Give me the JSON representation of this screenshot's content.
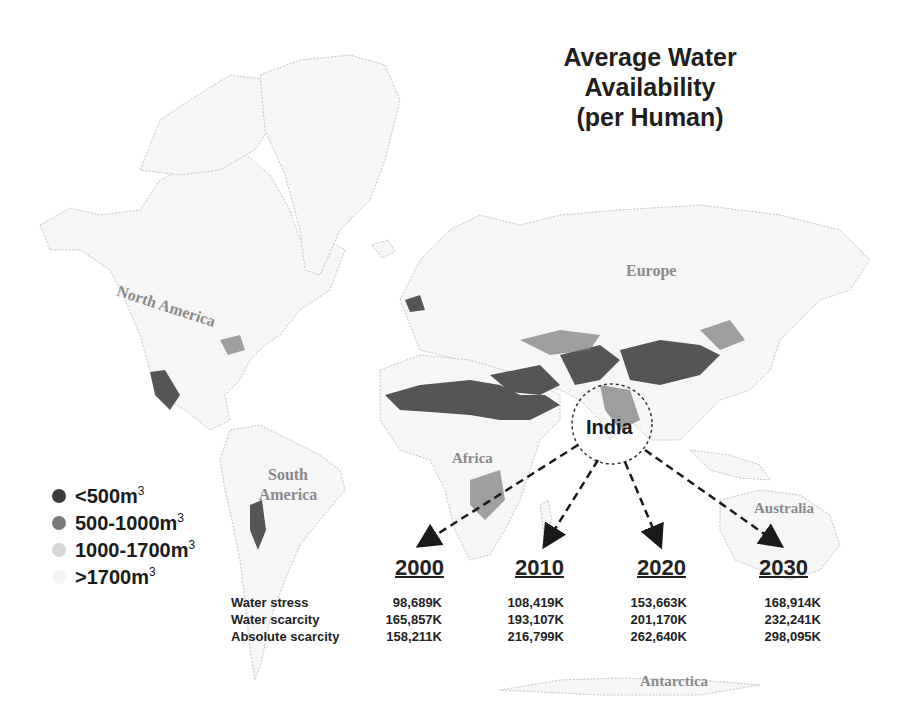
{
  "title": {
    "line1": "Average Water Availability",
    "line2": "(per Human)"
  },
  "regions": {
    "north_america": "North America",
    "south_america": "South America",
    "europe": "Europe",
    "africa": "Africa",
    "australia": "Australia",
    "antarctica": "Antarctica",
    "india": "India"
  },
  "legend": {
    "items": [
      {
        "label": "<500m",
        "sup": "3",
        "color": "#3c3c3c"
      },
      {
        "label": "500-1000m",
        "sup": "3",
        "color": "#7a7a7a"
      },
      {
        "label": "1000-1700m",
        "sup": "3",
        "color": "#d6d6d6"
      },
      {
        "label": ">1700m",
        "sup": "3",
        "color": "#f4f4f4"
      }
    ]
  },
  "table": {
    "years": [
      "2000",
      "2010",
      "2020",
      "2030"
    ],
    "rows": [
      {
        "label": "Water stress",
        "values": [
          "98,689K",
          "108,419K",
          "153,663K",
          "168,914K"
        ]
      },
      {
        "label": "Water scarcity",
        "values": [
          "165,857K",
          "193,107K",
          "201,170K",
          "232,241K"
        ]
      },
      {
        "label": "Absolute scarcity",
        "values": [
          "158,211K",
          "216,799K",
          "262,640K",
          "298,095K"
        ]
      }
    ]
  },
  "colors": {
    "land_fill": "#f6f6f6",
    "land_outline": "#c4c4c4",
    "scarce": "#3a3a3a",
    "stress": "#7a7a7a",
    "text": "#1e1e1e"
  }
}
